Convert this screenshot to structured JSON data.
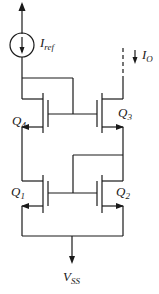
{
  "diagram": {
    "type": "circuit-schematic",
    "current_source": {
      "label": "I",
      "label_sub": "ref"
    },
    "output_current": {
      "label": "I",
      "label_sub": "O"
    },
    "transistors": [
      {
        "id": "Q4",
        "label": "Q",
        "label_sub": "4"
      },
      {
        "id": "Q3",
        "label": "Q",
        "label_sub": "3"
      },
      {
        "id": "Q1",
        "label": "Q",
        "label_sub": "1"
      },
      {
        "id": "Q2",
        "label": "Q",
        "label_sub": "2"
      }
    ],
    "supply": {
      "label": "V",
      "label_sub": "SS"
    }
  }
}
